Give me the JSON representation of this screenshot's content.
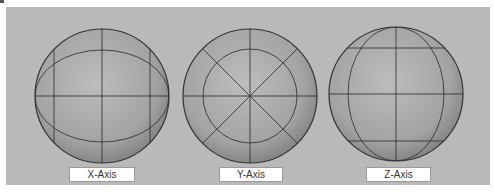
{
  "figure": {
    "background_color": "#b9b9b9",
    "sphere_fill": "#a8a8a8",
    "line_color": "#2a2a2a",
    "spheres": [
      {
        "id": "x",
        "label": "X-Axis",
        "description": "Sphere rotated about X-axis: horizontal equator, vertical meridian, two vertical side lines and elliptical latitude ring"
      },
      {
        "id": "y",
        "label": "Y-Axis",
        "description": "Sphere viewed along Y-axis: inner concentric circle with radial spokes at 0°, 45°, 90°, 135°"
      },
      {
        "id": "z",
        "label": "Z-Axis",
        "description": "Sphere rotated about Z-axis: vertical ellipse longitude ring, horizontal equator, top and bottom latitude lines"
      }
    ]
  }
}
